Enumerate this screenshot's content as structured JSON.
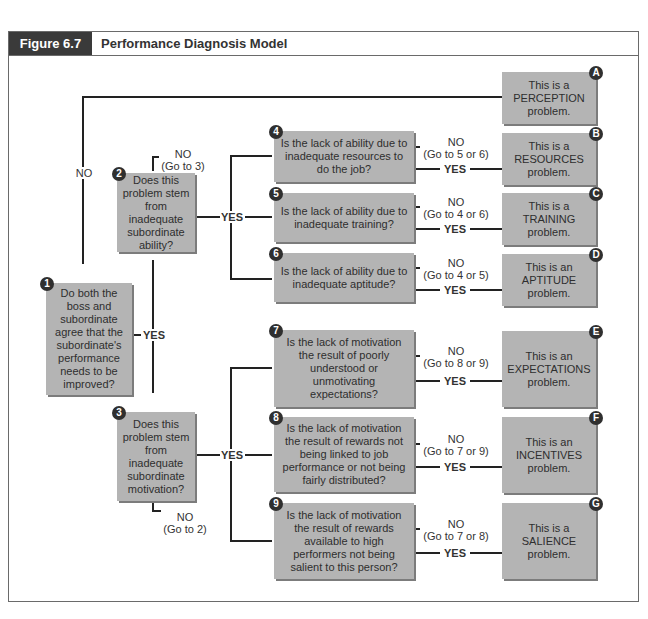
{
  "figure": {
    "label": "Figure 6.7",
    "title": "Performance Diagnosis Model"
  },
  "questions": [
    {
      "num": "1",
      "text": "Do both the boss and subordinate agree that the subordinate's performance needs to be improved?"
    },
    {
      "num": "2",
      "text": "Does this problem stem from inadequate subordinate ability?"
    },
    {
      "num": "3",
      "text": "Does this problem stem from inadequate subordinate motivation?"
    },
    {
      "num": "4",
      "text": "Is the lack of ability due to inadequate resources to do the job?"
    },
    {
      "num": "5",
      "text": "Is the lack of ability due to inadequate training?"
    },
    {
      "num": "6",
      "text": "Is the lack of ability due to inadequate aptitude?"
    },
    {
      "num": "7",
      "text": "Is the lack of motivation the result of poorly understood or unmotivating expectations?"
    },
    {
      "num": "8",
      "text": "Is the lack of motivation the result of rewards not being linked to job performance or not being fairly distributed?"
    },
    {
      "num": "9",
      "text": "Is the lack of motivation the result of rewards available to high performers not being salient to this person?"
    }
  ],
  "outcomes": [
    {
      "letter": "A",
      "text": "This is a PERCEPTION problem."
    },
    {
      "letter": "B",
      "text": "This is a RESOURCES problem."
    },
    {
      "letter": "C",
      "text": "This is a TRAINING problem."
    },
    {
      "letter": "D",
      "text": "This is an APTITUDE problem."
    },
    {
      "letter": "E",
      "text": "This is an EXPECTATIONS problem."
    },
    {
      "letter": "F",
      "text": "This is an INCENTIVES problem."
    },
    {
      "letter": "G",
      "text": "This is a SALIENCE problem."
    }
  ],
  "labels": {
    "yes": "YES",
    "no": "NO",
    "q2_no": "(Go to 3)",
    "q3_no": "(Go to 2)",
    "q4_no": "(Go to 5 or 6)",
    "q5_no": "(Go to 4 or 6)",
    "q6_no": "(Go to 4 or 5)",
    "q7_no": "(Go to 8 or 9)",
    "q8_no": "(Go to 7 or 9)",
    "q9_no": "(Go to 7 or 8)"
  }
}
